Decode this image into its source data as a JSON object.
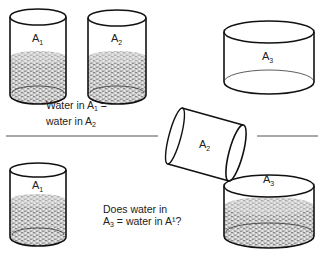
{
  "diagram": {
    "containers": {
      "a1_top": {
        "label": "A",
        "subscript": "1",
        "filled": true
      },
      "a2_top": {
        "label": "A",
        "subscript": "2",
        "filled": true
      },
      "a3_top": {
        "label": "A",
        "subscript": "3",
        "filled": false
      },
      "a2_tilted": {
        "label": "A",
        "subscript": "2",
        "state": "pouring"
      },
      "a1_bottom": {
        "label": "A",
        "subscript": "1",
        "filled": true
      },
      "a3_bottom": {
        "label": "A",
        "subscript": "3",
        "filled": true
      }
    },
    "caption_top": {
      "line1_prefix": "Water in A",
      "line1_sub": "1",
      "line1_suffix": " =",
      "line2_prefix": "water in A",
      "line2_sub": "2"
    },
    "caption_bottom": {
      "line1": "Does water in",
      "line2_prefix": "A",
      "line2_sub": "3",
      "line2_suffix": " = water in A¹?"
    },
    "colors": {
      "stroke": "#111111",
      "water": "#9a9a9a",
      "water_light": "#d8d8d8"
    }
  }
}
